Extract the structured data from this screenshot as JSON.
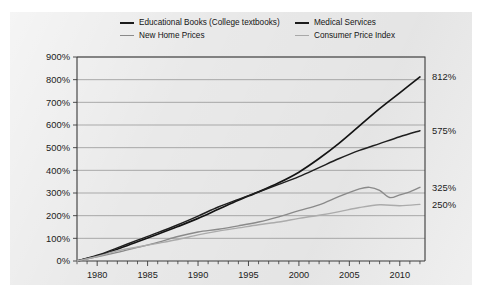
{
  "chart_data": {
    "type": "line",
    "title": "",
    "xlabel": "",
    "ylabel": "",
    "xlim": [
      1978,
      2012.5
    ],
    "ylim": [
      0,
      900
    ],
    "grid": true,
    "legend_position": "top",
    "y_ticks": [
      "0%",
      "100%",
      "200%",
      "300%",
      "400%",
      "500%",
      "600%",
      "700%",
      "800%",
      "900%"
    ],
    "y_tick_values": [
      0,
      100,
      200,
      300,
      400,
      500,
      600,
      700,
      800,
      900
    ],
    "x_ticks": [
      "1980",
      "1985",
      "1990",
      "1995",
      "2000",
      "2005",
      "2010"
    ],
    "x_tick_values": [
      1980,
      1985,
      1990,
      1995,
      2000,
      2005,
      2010
    ],
    "x_minor_step": 1,
    "end_labels": [
      "812%",
      "575%",
      "325%",
      "250%"
    ],
    "series": [
      {
        "name": "Educational Books (College textbooks)",
        "color": "#141414",
        "end_label": "812%",
        "x": [
          1978,
          1980,
          1982,
          1984,
          1986,
          1988,
          1990,
          1992,
          1994,
          1996,
          1998,
          2000,
          2002,
          2004,
          2006,
          2008,
          2010,
          2012
        ],
        "values": [
          0,
          22,
          52,
          85,
          118,
          152,
          188,
          228,
          268,
          305,
          345,
          392,
          452,
          520,
          596,
          672,
          742,
          812
        ]
      },
      {
        "name": "Medical Services",
        "color": "#1f1f1f",
        "end_label": "575%",
        "x": [
          1978,
          1980,
          1982,
          1984,
          1986,
          1988,
          1990,
          1992,
          1994,
          1996,
          1998,
          2000,
          2002,
          2004,
          2006,
          2008,
          2010,
          2012
        ],
        "values": [
          0,
          25,
          58,
          92,
          125,
          160,
          198,
          238,
          272,
          305,
          338,
          372,
          412,
          452,
          488,
          518,
          548,
          575
        ]
      },
      {
        "name": "New Home Prices",
        "color": "#8a8a8a",
        "end_label": "325%",
        "x": [
          1978,
          1980,
          1982,
          1984,
          1986,
          1988,
          1990,
          1992,
          1994,
          1996,
          1998,
          2000,
          2002,
          2004,
          2006,
          2007,
          2008,
          2009,
          2010,
          2011,
          2012
        ],
        "values": [
          0,
          18,
          38,
          60,
          82,
          108,
          128,
          140,
          155,
          172,
          195,
          222,
          248,
          285,
          318,
          325,
          312,
          280,
          292,
          305,
          325
        ]
      },
      {
        "name": "Consumer Price Index",
        "color": "#ababab",
        "end_label": "250%",
        "x": [
          1978,
          1980,
          1982,
          1984,
          1986,
          1988,
          1990,
          1992,
          1994,
          1996,
          1998,
          2000,
          2002,
          2004,
          2006,
          2008,
          2010,
          2012
        ],
        "values": [
          0,
          20,
          45,
          62,
          78,
          95,
          115,
          132,
          146,
          160,
          172,
          188,
          202,
          218,
          236,
          248,
          244,
          250
        ]
      }
    ]
  },
  "legend": {
    "items": [
      {
        "label": "Educational Books (College textbooks)"
      },
      {
        "label": "Medical Services"
      },
      {
        "label": "New Home Prices"
      },
      {
        "label": "Consumer Price Index"
      }
    ]
  }
}
